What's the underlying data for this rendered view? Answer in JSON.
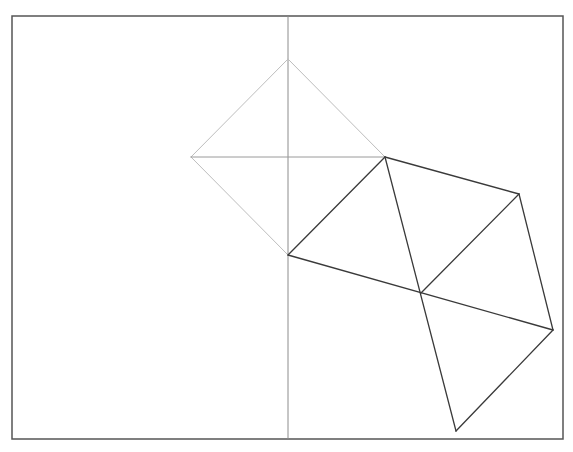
{
  "canvas": {
    "width": 573,
    "height": 452,
    "background": "#ffffff"
  },
  "frame": {
    "x": 12,
    "y": 16,
    "width": 551,
    "height": 423,
    "stroke": "#555555",
    "stroke_width": 1.5
  },
  "colors": {
    "light_edge": "#bdbdbd",
    "mid_edge": "#9a9a9a",
    "axis": "#8c8c8c",
    "dark_edge": "#3a3a3a"
  },
  "vertices": {
    "A": [
      288,
      59
    ],
    "B": [
      191,
      157
    ],
    "C": [
      385,
      157
    ],
    "D": [
      288,
      255
    ],
    "E": [
      519,
      194
    ],
    "F": [
      421,
      293
    ],
    "G": [
      553,
      330
    ],
    "H": [
      456,
      431
    ]
  },
  "axis": {
    "x": 288,
    "y1": 16,
    "y2": 439
  },
  "segments": [
    {
      "name": "edge-a-b",
      "from": "A",
      "to": "B",
      "style": "light_edge"
    },
    {
      "name": "edge-a-c",
      "from": "A",
      "to": "C",
      "style": "light_edge"
    },
    {
      "name": "edge-b-d",
      "from": "B",
      "to": "D",
      "style": "light_edge"
    },
    {
      "name": "diagonal-b-c",
      "from": "B",
      "to": "C",
      "style": "mid_edge"
    },
    {
      "name": "diagonal-c-d",
      "from": "C",
      "to": "D",
      "style": "dark_edge"
    },
    {
      "name": "edge-c-e",
      "from": "C",
      "to": "E",
      "style": "dark_edge"
    },
    {
      "name": "edge-e-g",
      "from": "E",
      "to": "G",
      "style": "dark_edge"
    },
    {
      "name": "edge-d-g",
      "from": "D",
      "to": "G",
      "style": "dark_edge"
    },
    {
      "name": "edge-c-h",
      "from": "C",
      "to": "H",
      "style": "dark_edge"
    },
    {
      "name": "diagonal-e-f",
      "from": "E",
      "to": "F",
      "style": "dark_edge"
    },
    {
      "name": "edge-g-h",
      "from": "G",
      "to": "H",
      "style": "dark_edge"
    }
  ]
}
